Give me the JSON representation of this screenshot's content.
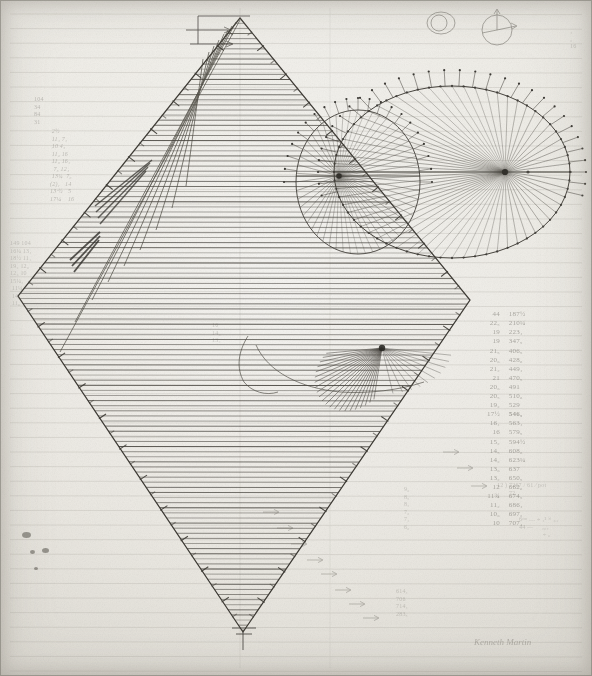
{
  "document": {
    "kind": "hand-drawn geometric manuscript",
    "medium": "pencil and ink on ruled paper",
    "title": "Geometric construction study — hatched rhombus with elliptical pencils of rays",
    "signature": "Kenneth Martin",
    "paper_color": "#e8e6df",
    "ink_color": "#3a372f",
    "pencil_color": "#4a473f",
    "rule_color": "#9a978d"
  },
  "figures": {
    "rhombus": {
      "label": "hatched rhombus",
      "top_vertex": "240,18",
      "left_vertex": "18,296",
      "bottom_vertex": "243,632",
      "right_vertex": "470,300",
      "hatch": "dense horizontal lines",
      "edge_ticks": "perpendicular tick marks along all four edges"
    },
    "large_ellipse": {
      "label": "large ellipse with focal ray pencil",
      "center": "452,172",
      "rx": 118,
      "ry": 86,
      "focus": "505,172",
      "rays": 64,
      "boundary": "dotted / stippled points"
    },
    "small_ellipse": {
      "label": "small ellipse with focal ray pencil",
      "center": "358,182",
      "rx": 62,
      "ry": 72,
      "focus": "339,176",
      "rays": 52,
      "boundary": "fine continuous curve"
    },
    "inner_fan": {
      "label": "inner radiating fan",
      "apex": "382,348",
      "rays": 22
    },
    "circle_sketch_a": {
      "label": "small circle sketch",
      "center": "441,23",
      "r": 13
    },
    "circle_sketch_b": {
      "label": "small circle with vector arrows",
      "center": "497,30",
      "r": 15,
      "arrows": "up arrow and right arrow from centre"
    }
  },
  "annotations": {
    "left_column_upper": "104\n34\n84\n31",
    "left_column_values": " 2½\n 11₄ 7₄\n 10 4₅\n 11₂ 16\n 11₆ 16₄\n  7₅ 12₄\n 13¾  7₆\n(2)₄   14\n13·½   5\n17¼    16",
    "left_column_lower": "149 104\n16¼ 13₄\n18½ 11₄\n19₂ 12₆\n12₆ 10\n15¼₄\n 11¼\n 14₆\n 11₆",
    "right_column_pairs": [
      [
        "44",
        "187½"
      ],
      [
        "22₅",
        "210¼"
      ],
      [
        "19",
        "223₄"
      ],
      [
        "19",
        "347₅"
      ],
      [
        "21₅",
        "406₅"
      ],
      [
        "20₆",
        "428₆"
      ],
      [
        "21₂",
        "449₄"
      ],
      [
        "21",
        "470₅"
      ],
      [
        "20₆",
        "491"
      ],
      [
        "20₅",
        "510₆"
      ],
      [
        "19₂",
        "529"
      ],
      [
        "17½",
        "546₅"
      ],
      [
        "16₄",
        "563₄"
      ],
      [
        "16",
        "579₅"
      ],
      [
        "15₂",
        "594½"
      ],
      [
        "14₅",
        "608₆"
      ],
      [
        "14₂",
        "623¼"
      ],
      [
        "13₆",
        "637"
      ],
      [
        "13₂",
        "650₅"
      ],
      [
        "12",
        "662₆"
      ],
      [
        "11¾",
        "674₅"
      ],
      [
        "11₂",
        "686₄"
      ],
      [
        "10₆",
        "697₂"
      ],
      [
        "10",
        "707₄"
      ]
    ],
    "lower_left_fraction_list": "9₆\n8₅\n8₂\n7₆\n7₂\n6₆",
    "long_division": "12 ) 7267 / 61 ⁄ pot\n       72",
    "formula_block": "6ᵍᵐ … ÷ ₄² × ₆₄\n44 —     ₂₆₄\n              ÷ ₆",
    "bottom_right_tail": "614₄\n706\n714₄\n283₅",
    "center_marks": "16\n14₆\n13₄",
    "right_edge_marks": "₄\n₂\n16"
  },
  "marks": {
    "ink_blots": [
      {
        "x": 22,
        "y": 532,
        "w": 9,
        "h": 6
      },
      {
        "x": 42,
        "y": 548,
        "w": 7,
        "h": 5
      },
      {
        "x": 30,
        "y": 550,
        "w": 5,
        "h": 4
      },
      {
        "x": 34,
        "y": 567,
        "w": 4,
        "h": 3
      }
    ]
  }
}
